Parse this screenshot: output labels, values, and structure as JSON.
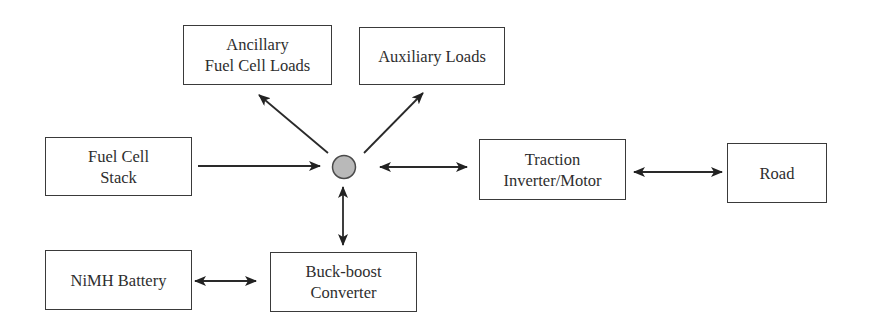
{
  "diagram": {
    "type": "block-diagram",
    "hub": {
      "label": "",
      "fill": "#b9b9b9",
      "stroke": "#4a4a4a"
    },
    "blocks": {
      "ancillary": {
        "line1": "Ancillary",
        "line2": "Fuel Cell Loads"
      },
      "auxiliary": {
        "line1": "Auxiliary Loads"
      },
      "fuel_cell": {
        "line1": "Fuel Cell",
        "line2": "Stack"
      },
      "traction": {
        "line1": "Traction",
        "line2": "Inverter/Motor"
      },
      "road": {
        "line1": "Road"
      },
      "battery": {
        "line1": "NiMH Battery"
      },
      "buck_boost": {
        "line1": "Buck-boost",
        "line2": "Converter"
      }
    },
    "connections": [
      {
        "from": "Fuel Cell Stack",
        "to": "hub",
        "direction": "unidirectional"
      },
      {
        "from": "hub",
        "to": "Ancillary Fuel Cell Loads",
        "direction": "unidirectional"
      },
      {
        "from": "hub",
        "to": "Auxiliary Loads",
        "direction": "unidirectional"
      },
      {
        "from": "hub",
        "to": "Traction Inverter/Motor",
        "direction": "bidirectional"
      },
      {
        "from": "Traction Inverter/Motor",
        "to": "Road",
        "direction": "bidirectional"
      },
      {
        "from": "hub",
        "to": "Buck-boost Converter",
        "direction": "bidirectional"
      },
      {
        "from": "NiMH Battery",
        "to": "Buck-boost Converter",
        "direction": "bidirectional"
      }
    ],
    "colors": {
      "line": "#2a2a2a",
      "box_border": "#3a3a3a",
      "text": "#2e2e2e"
    }
  }
}
